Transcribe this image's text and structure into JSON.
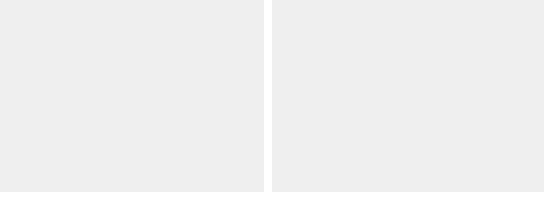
{
  "figure": {
    "background": "#ffffff",
    "panel_background": "#efefef",
    "line_color": "#2b2b2b",
    "grid_color": "#d4d4d4"
  },
  "chart_data": [
    {
      "type": "line",
      "title": "",
      "xlabel": "Year",
      "ylabel": "",
      "xlim": [
        1990,
        2010
      ],
      "ylim": [
        20,
        100
      ],
      "xticks": [
        1990,
        1995,
        2000,
        2005,
        2010
      ],
      "xtick_labels": [
        "1990",
        "1995",
        "2000",
        "2005",
        "2010"
      ],
      "yticks": [
        20,
        40,
        60,
        80,
        100
      ],
      "ytick_labels": [
        "20",
        "40",
        "60",
        "80",
        "100"
      ],
      "grid": true,
      "grid_axis": "y",
      "legend": "inline-annotations",
      "x": [
        1990,
        1991,
        1992,
        1993,
        1994,
        1995,
        1996,
        1997,
        1998,
        1999,
        2000,
        2001,
        2002,
        2003,
        2004,
        2005,
        2006,
        2007
      ],
      "series": [
        {
          "name": "Conflict",
          "style": "solid",
          "label_x": 2001.4,
          "label_y": 74.5,
          "values": [
            89,
            84,
            84,
            84,
            83,
            76,
            76,
            76,
            75,
            75,
            69,
            69,
            69,
            69,
            69,
            63,
            63,
            63
          ]
        },
        {
          "name": "Post-Conflict",
          "style": "dotted",
          "label_x": 1995.2,
          "label_y": 55.5,
          "values": [
            52,
            52,
            52,
            52,
            52,
            48,
            48,
            48,
            48,
            47,
            45,
            45,
            45,
            45,
            45,
            41,
            41,
            41
          ]
        },
        {
          "name": "Not Conflict",
          "style": "dashed",
          "label_x": 1999.4,
          "label_y": 32.5,
          "values": [
            42,
            42,
            42,
            42,
            43,
            38,
            38,
            38,
            38,
            37,
            34,
            34,
            34,
            34,
            34,
            30,
            30,
            30
          ]
        }
      ]
    },
    {
      "type": "line",
      "title": "",
      "xlabel": "Year",
      "ylabel": "",
      "xlim": [
        1990,
        2010
      ],
      "ylim": [
        30,
        120
      ],
      "xticks": [
        1990,
        1995,
        2000,
        2005,
        2010
      ],
      "xtick_labels": [
        "1990",
        "1995",
        "2000",
        "2005",
        "2010"
      ],
      "yticks": [
        40,
        60,
        80,
        100,
        120
      ],
      "ytick_labels": [
        "40",
        "60",
        "80",
        "100",
        "120"
      ],
      "grid": true,
      "grid_axis": "y",
      "legend": "inline-annotations",
      "x": [
        1990,
        1991,
        1992,
        1993,
        1994,
        1995,
        1996,
        1997,
        1998,
        1999,
        2000,
        2001,
        2002,
        2003,
        2004,
        2005,
        2006,
        2007
      ],
      "series": [
        {
          "name": "Fragile States",
          "style": "solid",
          "label_x": 2000.6,
          "label_y": 93.0,
          "values": [
            108,
            108,
            96,
            99,
            97,
            90,
            91,
            92,
            92,
            85,
            87,
            89,
            89,
            89,
            87,
            82,
            82,
            81
          ]
        },
        {
          "name": "Not Fragile States",
          "style": "dashed",
          "label_x": 1996.6,
          "label_y": 54.0,
          "values": [
            54,
            52,
            51,
            50,
            50,
            46,
            47,
            47,
            47,
            44,
            41,
            40,
            39,
            38,
            39,
            35,
            34,
            35
          ]
        }
      ]
    }
  ]
}
